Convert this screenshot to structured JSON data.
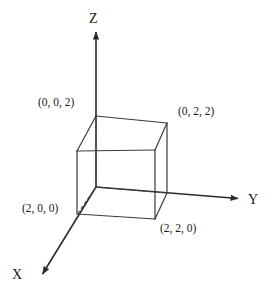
{
  "figure": {
    "background_color": "#ffffff",
    "stroke_color": "#333333",
    "text_color": "#1a1a1a"
  },
  "axes": [
    {
      "id": "z",
      "label": "Z",
      "direction": "up",
      "origin": {
        "x": 96,
        "y": 187
      },
      "tip": {
        "x": 96,
        "y": 30
      }
    },
    {
      "id": "y",
      "label": "Y",
      "direction": "right",
      "origin": {
        "x": 96,
        "y": 187
      },
      "tip": {
        "x": 241,
        "y": 199
      }
    },
    {
      "id": "x",
      "label": "X",
      "direction": "lower-left",
      "origin": {
        "x": 96,
        "y": 187
      },
      "tip": {
        "x": 40,
        "y": 278
      }
    }
  ],
  "cube": {
    "side_length": 2,
    "origin_vertex": {
      "x": 96,
      "y": 187
    },
    "vertices": [
      {
        "name": "origin-back-bottom-left",
        "coords": "(0, 0, 0)",
        "labelled": false,
        "px": {
          "x": 96,
          "y": 187
        }
      },
      {
        "name": "back-top-left",
        "coords": "(0, 0, 2)",
        "labelled": true,
        "px": {
          "x": 96,
          "y": 116
        }
      },
      {
        "name": "back-bottom-right",
        "coords": "(0, 2, 0)",
        "labelled": false,
        "px": {
          "x": 167,
          "y": 193
        }
      },
      {
        "name": "back-top-right",
        "coords": "(0, 2, 2)",
        "labelled": true,
        "px": {
          "x": 167,
          "y": 123
        }
      },
      {
        "name": "front-bottom-left",
        "coords": "(2, 0, 0)",
        "labelled": true,
        "px": {
          "x": 77,
          "y": 214
        }
      },
      {
        "name": "front-top-left",
        "coords": "(2, 0, 2)",
        "labelled": false,
        "px": {
          "x": 77,
          "y": 151
        }
      },
      {
        "name": "front-bottom-right",
        "coords": "(2, 2, 0)",
        "labelled": true,
        "px": {
          "x": 155,
          "y": 219
        }
      },
      {
        "name": "front-top-right",
        "coords": "(2, 2, 2)",
        "labelled": false,
        "px": {
          "x": 155,
          "y": 150
        }
      }
    ],
    "hidden_edges_style": "dashed"
  },
  "labels": {
    "vertex_0_0_2": "(0, 0, 2)",
    "vertex_0_2_2": "(0, 2, 2)",
    "vertex_2_0_0": "(2, 0, 0)",
    "vertex_2_2_0": "(2, 2, 0)",
    "axis_x": "X",
    "axis_y": "Y",
    "axis_z": "Z"
  }
}
